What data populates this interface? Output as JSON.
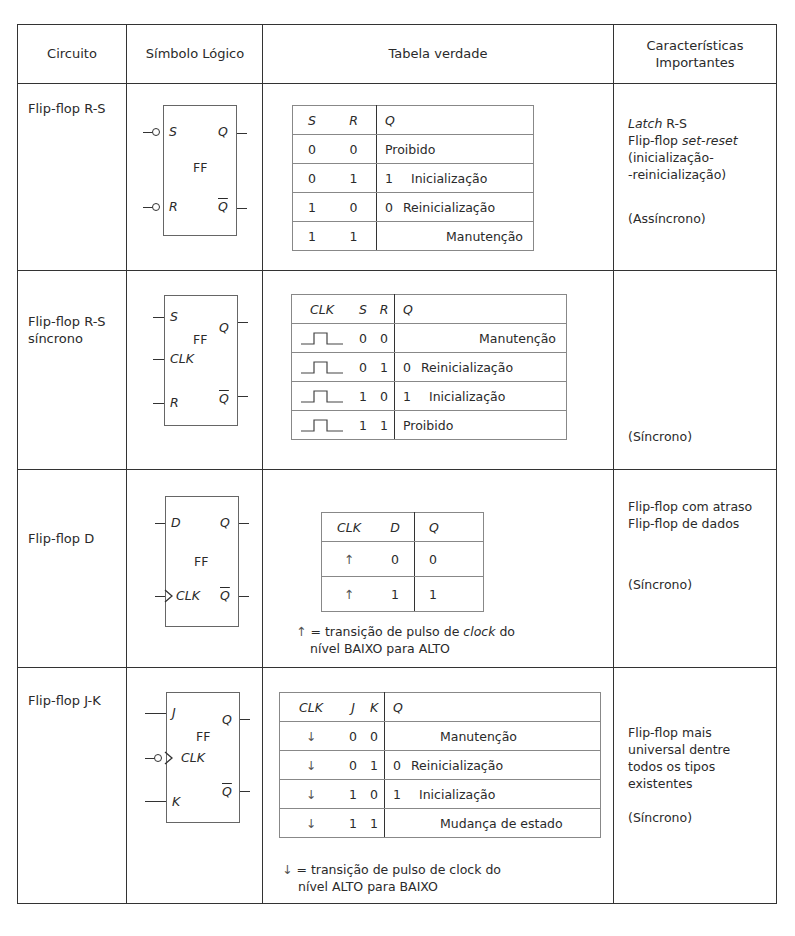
{
  "header": {
    "circuit": "Circuito",
    "symbol": "Símbolo Lógico",
    "truth_table": "Tabela verdade",
    "features_line1": "Características",
    "features_line2": "Importantes"
  },
  "rows": [
    {
      "name_lines": [
        "Flip-flop R-S"
      ],
      "symbol": {
        "center_label": "FF",
        "inputs": [
          "S",
          "R"
        ],
        "outputs": [
          "Q",
          "Q"
        ],
        "input_bubbles": true
      },
      "table": {
        "headers": [
          "S",
          "R",
          "Q"
        ],
        "rows": [
          {
            "a": "0",
            "b": "0",
            "q": "",
            "desc": "Proibido"
          },
          {
            "a": "0",
            "b": "1",
            "q": "1",
            "desc": "Inicialização"
          },
          {
            "a": "1",
            "b": "0",
            "q": "0",
            "desc": "Reinicialização"
          },
          {
            "a": "1",
            "b": "1",
            "q": "",
            "desc": "Manutenção"
          }
        ]
      },
      "features": {
        "latch_italic": "Latch",
        "latch_rest": " R-S",
        "line2_prefix": "Flip-flop ",
        "line2_italic": "set-reset",
        "line3": "(inicialização-",
        "line4": "-reinicialização)",
        "mode": "(Assíncrono)"
      }
    },
    {
      "name_lines": [
        "Flip-flop R-S",
        "síncrono"
      ],
      "symbol": {
        "center_label": "FF",
        "inputs": [
          "S",
          "CLK",
          "R"
        ],
        "outputs": [
          "Q",
          "Q"
        ]
      },
      "table": {
        "headers": [
          "CLK",
          "S",
          "R",
          "Q"
        ],
        "rows": [
          {
            "clk": "pulse",
            "a": "0",
            "b": "0",
            "q": "",
            "desc": "Manutenção"
          },
          {
            "clk": "pulse",
            "a": "0",
            "b": "1",
            "q": "0",
            "desc": "Reinicialização"
          },
          {
            "clk": "pulse",
            "a": "1",
            "b": "0",
            "q": "1",
            "desc": "Inicialização"
          },
          {
            "clk": "pulse",
            "a": "1",
            "b": "1",
            "q": "",
            "desc": "Proibido"
          }
        ]
      },
      "features": {
        "mode": "(Síncrono)"
      }
    },
    {
      "name_lines": [
        "Flip-flop D"
      ],
      "symbol": {
        "center_label": "FF",
        "inputs": [
          "D",
          "CLK"
        ],
        "outputs": [
          "Q",
          "Q"
        ],
        "clk_edge": "rising"
      },
      "table": {
        "headers": [
          "CLK",
          "D",
          "Q"
        ],
        "rows": [
          {
            "clk": "↑",
            "d": "0",
            "q": "0"
          },
          {
            "clk": "↑",
            "d": "1",
            "q": "1"
          }
        ]
      },
      "note": {
        "arrow": "↑",
        "line1_prefix": " = transição de pulso de ",
        "line1_italic": "clock",
        "line1_suffix": " do",
        "line2": "nível BAIXO para ALTO"
      },
      "features": {
        "line1": "Flip-flop com atraso",
        "line2": "Flip-flop de dados",
        "mode": "(Síncrono)"
      }
    },
    {
      "name_lines": [
        "Flip-flop J-K"
      ],
      "symbol": {
        "center_label": "FF",
        "inputs": [
          "J",
          "CLK",
          "K"
        ],
        "outputs": [
          "Q",
          "Q"
        ],
        "clk_edge": "falling"
      },
      "table": {
        "headers": [
          "CLK",
          "J",
          "K",
          "Q"
        ],
        "rows": [
          {
            "clk": "↓",
            "a": "0",
            "b": "0",
            "q": "",
            "desc": "Manutenção"
          },
          {
            "clk": "↓",
            "a": "0",
            "b": "1",
            "q": "0",
            "desc": "Reinicialização"
          },
          {
            "clk": "↓",
            "a": "1",
            "b": "0",
            "q": "1",
            "desc": "Inicialização"
          },
          {
            "clk": "↓",
            "a": "1",
            "b": "1",
            "q": "",
            "desc": "Mudança de estado"
          }
        ]
      },
      "note": {
        "arrow": "↓",
        "line1": " = transição de pulso de clock do",
        "line2": "nível ALTO para BAIXO"
      },
      "features": {
        "line1": "Flip-flop mais",
        "line2": "universal dentre",
        "line3": "todos os tipos",
        "line4": "existentes",
        "mode": "(Síncrono)"
      }
    }
  ]
}
